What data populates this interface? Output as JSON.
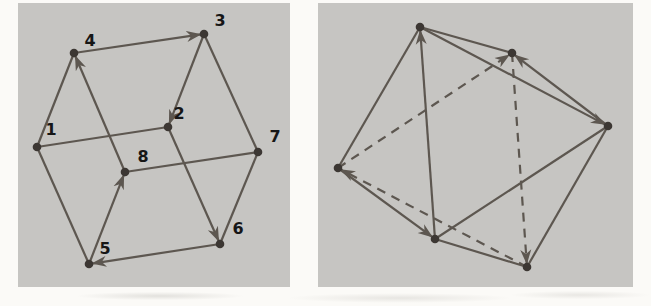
{
  "figure": {
    "colors": {
      "page_background": "#fbfaf7",
      "panel_background": "#c6c5c2",
      "edge": "#5d5750",
      "node": "#3c3733",
      "arrow": "#5d5750",
      "label": "#161616"
    },
    "style": {
      "edge_width": 2.2,
      "node_radius": 4.3,
      "dash_pattern": "9 7",
      "label_font_size": 16
    },
    "panels": [
      {
        "name": "cube-graph",
        "title": "directed cube graph",
        "width": 272,
        "height": 284,
        "vertices": [
          {
            "id": "1",
            "label": "1",
            "x": 19,
            "y": 144,
            "lx": 33,
            "ly": 127
          },
          {
            "id": "2",
            "label": "2",
            "x": 150,
            "y": 124,
            "lx": 161,
            "ly": 111
          },
          {
            "id": "3",
            "label": "3",
            "x": 186,
            "y": 31,
            "lx": 202,
            "ly": 18
          },
          {
            "id": "4",
            "label": "4",
            "x": 56,
            "y": 50,
            "lx": 72,
            "ly": 38
          },
          {
            "id": "5",
            "label": "5",
            "x": 71,
            "y": 261,
            "lx": 87,
            "ly": 246
          },
          {
            "id": "6",
            "label": "6",
            "x": 202,
            "y": 241,
            "lx": 220,
            "ly": 226
          },
          {
            "id": "7",
            "label": "7",
            "x": 240,
            "y": 149,
            "lx": 257,
            "ly": 134
          },
          {
            "id": "8",
            "label": "8",
            "x": 107,
            "y": 169,
            "lx": 125,
            "ly": 154
          }
        ],
        "edges": [
          {
            "from": "1",
            "to": "2",
            "directed": false,
            "dashed": false
          },
          {
            "from": "1",
            "to": "4",
            "directed": false,
            "dashed": false
          },
          {
            "from": "1",
            "to": "5",
            "directed": false,
            "dashed": false
          },
          {
            "from": "3",
            "to": "7",
            "directed": false,
            "dashed": false
          },
          {
            "from": "6",
            "to": "7",
            "directed": false,
            "dashed": false
          },
          {
            "from": "7",
            "to": "8",
            "directed": false,
            "dashed": false
          },
          {
            "from": "4",
            "to": "3",
            "directed": true,
            "dashed": false
          },
          {
            "from": "3",
            "to": "2",
            "directed": true,
            "dashed": false
          },
          {
            "from": "2",
            "to": "6",
            "directed": true,
            "dashed": false
          },
          {
            "from": "6",
            "to": "5",
            "directed": true,
            "dashed": false
          },
          {
            "from": "5",
            "to": "8",
            "directed": true,
            "dashed": false
          },
          {
            "from": "8",
            "to": "4",
            "directed": true,
            "dashed": false
          }
        ]
      },
      {
        "name": "octahedron-graph",
        "title": "directed octahedron graph",
        "width": 315,
        "height": 284,
        "vertices": [
          {
            "id": "T",
            "label": "",
            "x": 102,
            "y": 24
          },
          {
            "id": "UR",
            "label": "",
            "x": 194,
            "y": 50
          },
          {
            "id": "R",
            "label": "",
            "x": 290,
            "y": 123
          },
          {
            "id": "BR",
            "label": "",
            "x": 209,
            "y": 264
          },
          {
            "id": "BC",
            "label": "",
            "x": 117,
            "y": 236
          },
          {
            "id": "L",
            "label": "",
            "x": 20,
            "y": 165
          }
        ],
        "edges": [
          {
            "from": "T",
            "to": "UR",
            "directed": false,
            "dashed": false
          },
          {
            "from": "R",
            "to": "BR",
            "directed": false,
            "dashed": false
          },
          {
            "from": "BR",
            "to": "BC",
            "directed": false,
            "dashed": false
          },
          {
            "from": "L",
            "to": "T",
            "directed": false,
            "dashed": false
          },
          {
            "from": "R",
            "to": "BC",
            "directed": false,
            "dashed": false
          },
          {
            "from": "BC",
            "to": "T",
            "directed": true,
            "dashed": false
          },
          {
            "from": "T",
            "to": "R",
            "directed": true,
            "dashed": false
          },
          {
            "from": "R",
            "to": "UR",
            "directed": true,
            "dashed": false
          },
          {
            "from": "L",
            "to": "BC",
            "directed": true,
            "dashed": false
          },
          {
            "from": "L",
            "to": "UR",
            "directed": true,
            "dashed": true
          },
          {
            "from": "UR",
            "to": "BR",
            "directed": true,
            "dashed": true
          },
          {
            "from": "BR",
            "to": "L",
            "directed": true,
            "dashed": true
          }
        ]
      }
    ]
  }
}
